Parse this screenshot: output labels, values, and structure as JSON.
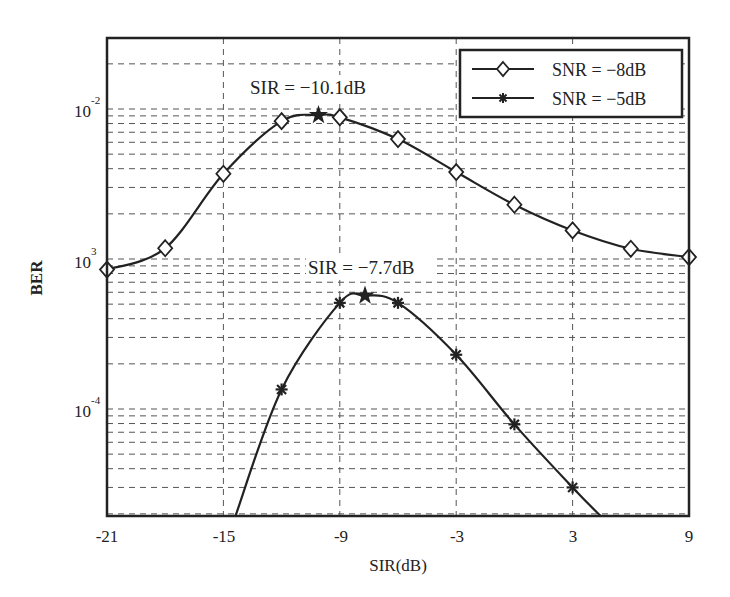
{
  "chart_data": {
    "type": "line",
    "title": "",
    "xlabel": "SIR(dB)",
    "ylabel": "BER",
    "yscale": "log",
    "xlim": [
      -21,
      9
    ],
    "ylim": [
      1.9e-05,
      0.03
    ],
    "grid": true,
    "legend_position": "upper right",
    "x_ticks": [
      -21,
      -15,
      -9,
      -3,
      3,
      9
    ],
    "x_tick_labels": [
      "-21",
      "-15",
      "-9",
      "-3",
      "3",
      "9"
    ],
    "y_ticks": [
      0.01,
      0.001,
      0.0001
    ],
    "y_tick_labels": [
      {
        "base": "10",
        "exp": "-2"
      },
      {
        "base": "10",
        "exp": "3"
      },
      {
        "base": "10",
        "exp": "-4"
      }
    ],
    "series": [
      {
        "name": "SNR = −8dB",
        "marker": "diamond",
        "x": [
          -21,
          -18,
          -15,
          -12,
          -9,
          -6,
          -3,
          0,
          3,
          6,
          9
        ],
        "values": [
          0.00085,
          0.00118,
          0.0037,
          0.0083,
          0.0088,
          0.0063,
          0.0038,
          0.0023,
          0.00155,
          0.00117,
          0.00103
        ],
        "peak": {
          "x": -10.1,
          "y": 0.0091,
          "marker": "star",
          "label": "SIR = −10.1dB"
        }
      },
      {
        "name": "SNR = −5dB",
        "marker": "star",
        "x": [
          -14.4,
          -12,
          -9,
          -6,
          -3,
          0,
          3,
          4.5
        ],
        "values": [
          1.9e-05,
          0.000135,
          0.00051,
          0.00051,
          0.00023,
          7.9e-05,
          3e-05,
          1.9e-05
        ],
        "peak": {
          "x": -7.7,
          "y": 0.00057,
          "marker": "star",
          "label": "SIR = −7.7dB"
        }
      }
    ],
    "annotations": [
      "SIR = −10.1dB",
      "SIR = −7.7dB"
    ]
  },
  "legend": {
    "items": [
      {
        "label": "SNR = −8dB",
        "marker": "diamond"
      },
      {
        "label": "SNR = −5dB",
        "marker": "star"
      }
    ]
  },
  "axes": {
    "xlabel": "SIR(dB)",
    "ylabel": "BER",
    "yticks": {
      "t0": {
        "base": "10",
        "exp": "-2"
      },
      "t1": {
        "base": "10",
        "exp": "3"
      },
      "t2": {
        "base": "10",
        "exp": "-4"
      }
    },
    "xticks": [
      "-21",
      "-15",
      "-9",
      "-3",
      "3",
      "9"
    ]
  },
  "annotations": {
    "peak1": "SIR = −10.1dB",
    "peak2": "SIR = −7.7dB"
  }
}
